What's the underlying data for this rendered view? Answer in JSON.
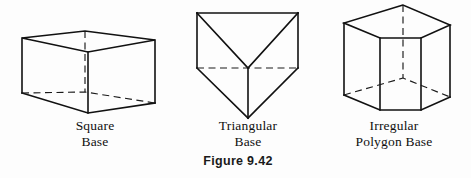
{
  "figure": {
    "number_label": "Figure 9.42",
    "background_color": "#fdfdfd",
    "ink_color": "#111111"
  },
  "items": [
    {
      "id": "square-prism",
      "shape_name": "square-base-prism",
      "caption_line1": "Square",
      "caption_line2": "Base"
    },
    {
      "id": "triangular-prism",
      "shape_name": "triangular-base-prism",
      "caption_line1": "Triangular",
      "caption_line2": "Base"
    },
    {
      "id": "irregular-prism",
      "shape_name": "irregular-polygon-base-prism",
      "caption_line1": "Irregular",
      "caption_line2": "Polygon Base"
    }
  ]
}
